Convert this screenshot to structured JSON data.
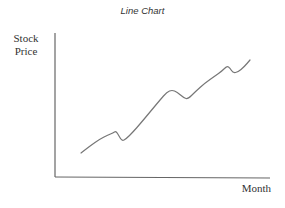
{
  "chart_data": {
    "type": "line",
    "title": "Line Chart",
    "xlabel": "Month",
    "ylabel": "Stock Price",
    "grid": false,
    "legend": null,
    "tick_labels": {
      "x": [],
      "y": []
    },
    "series": [
      {
        "name": "Stock Price",
        "color": "#777777",
        "points_px": [
          [
            81,
            153
          ],
          [
            90,
            146
          ],
          [
            100,
            139
          ],
          [
            108,
            135
          ],
          [
            113,
            133
          ],
          [
            116,
            131
          ],
          [
            119,
            136
          ],
          [
            122,
            141
          ],
          [
            126,
            139
          ],
          [
            133,
            132
          ],
          [
            140,
            124
          ],
          [
            150,
            112
          ],
          [
            160,
            100
          ],
          [
            167,
            92
          ],
          [
            172,
            90
          ],
          [
            177,
            92
          ],
          [
            184,
            98
          ],
          [
            188,
            99
          ],
          [
            195,
            92
          ],
          [
            205,
            83
          ],
          [
            215,
            76
          ],
          [
            222,
            71
          ],
          [
            227,
            66
          ],
          [
            230,
            68
          ],
          [
            233,
            73
          ],
          [
            238,
            72
          ],
          [
            244,
            67
          ],
          [
            250,
            60
          ]
        ],
        "values_normalized": [
          0.0,
          0.08,
          0.15,
          0.19,
          0.21,
          0.23,
          0.18,
          0.13,
          0.15,
          0.22,
          0.31,
          0.43,
          0.56,
          0.65,
          0.67,
          0.65,
          0.58,
          0.57,
          0.65,
          0.74,
          0.82,
          0.87,
          0.92,
          0.9,
          0.85,
          0.86,
          0.91,
          1.0
        ]
      }
    ],
    "axes": {
      "y_axis_x": 55,
      "y_axis_top": 33,
      "x_axis_y": 177,
      "x_axis_right": 270
    }
  },
  "labels": {
    "title": "Line Chart",
    "ylabel_line1": "Stock",
    "ylabel_line2": "Price",
    "xlabel": "Month"
  }
}
